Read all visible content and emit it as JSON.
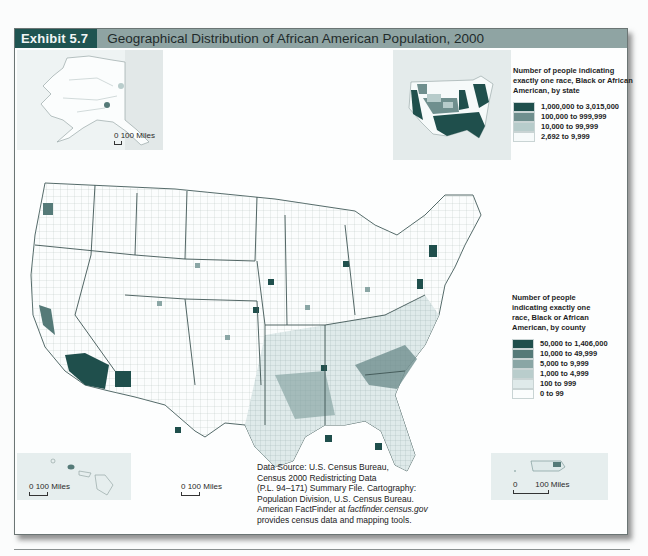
{
  "title_bar": {
    "exhibit_label": "Exhibit 5.7",
    "title": "Geographical Distribution of African American Population, 2000"
  },
  "insets": {
    "alaska": {
      "scale_label": "0 100 Miles"
    },
    "hawaii": {
      "scale_label": "0   100 Miles"
    },
    "southern_tip": {
      "scale_label": "0   100 Miles"
    },
    "puerto_rico": {
      "scale_label": "0        100 Miles"
    }
  },
  "state_legend": {
    "heading": "Number of people indicating exactly one race, Black or African American, by state",
    "items": [
      {
        "label": "1,000,000 to 3,015,000",
        "color": "#1f4f4c"
      },
      {
        "label": "100,000 to 999,999",
        "color": "#6f8f8e"
      },
      {
        "label": "10,000 to 99,999",
        "color": "#b7cccb"
      },
      {
        "label": "2,692 to 9,999",
        "color": "#f6fafa"
      }
    ]
  },
  "county_legend": {
    "heading": "Number of people indicating exactly one race, Black or African American, by county",
    "items": [
      {
        "label": "50,000 to 1,406,000",
        "color": "#1f4f4c"
      },
      {
        "label": "10,000 to 49,999",
        "color": "#557a78"
      },
      {
        "label": "5,000 to 9,999",
        "color": "#8aa6a5"
      },
      {
        "label": "1,000 to 4,999",
        "color": "#b9cdcc"
      },
      {
        "label": "100 to 999",
        "color": "#dfeaea"
      },
      {
        "label": "0 to 99",
        "color": "#fbfdfd"
      }
    ]
  },
  "source": {
    "line1": "Data Source: U.S. Census Bureau,",
    "line2": "Census 2000 Redistricting Data",
    "line3": "(P.L. 94–171) Summary File. Cartography:",
    "line4": "Population Division, U.S. Census Bureau.",
    "line5_prefix": "American FactFinder at ",
    "line5_link": "factfinder.census.gov",
    "line6": "provides census data and mapping tools."
  }
}
